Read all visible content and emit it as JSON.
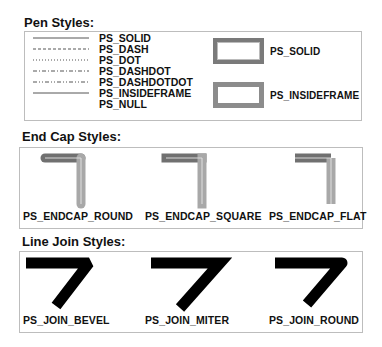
{
  "sections": {
    "pen": {
      "title": "Pen Styles:",
      "styles": [
        "PS_SOLID",
        "PS_DASH",
        "PS_DOT",
        "PS_DASHDOT",
        "PS_DASHDOTDOT",
        "PS_INSIDEFRAME",
        "PS_NULL"
      ],
      "frames": [
        {
          "label": "PS_SOLID",
          "border_color": "#7a7a7a"
        },
        {
          "label": "PS_INSIDEFRAME",
          "border_color": "#8c8c8c"
        }
      ]
    },
    "endcap": {
      "title": "End Cap Styles:",
      "items": [
        {
          "label": "PS_ENDCAP_ROUND"
        },
        {
          "label": "PS_ENDCAP_SQUARE"
        },
        {
          "label": "PS_ENDCAP_FLAT"
        }
      ],
      "colors": {
        "horizontal": "#707070",
        "vertical": "#a8a8a8",
        "center": "#e0e0e0"
      }
    },
    "join": {
      "title": "Line Join Styles:",
      "items": [
        {
          "label": "PS_JOIN_BEVEL"
        },
        {
          "label": "PS_JOIN_MITER"
        },
        {
          "label": "PS_JOIN_ROUND"
        }
      ],
      "color": "#000000"
    }
  }
}
